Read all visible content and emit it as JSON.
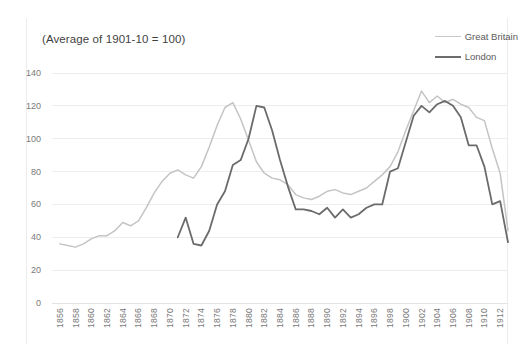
{
  "chart_data": {
    "type": "line",
    "title": "(Average of 1901-10 = 100)",
    "xlabel": "",
    "ylabel": "",
    "ylim": [
      0,
      140
    ],
    "xlim": [
      1855,
      1913
    ],
    "grid": true,
    "legend_position": "top-right",
    "yticks": [
      0,
      20,
      40,
      60,
      80,
      100,
      120,
      140
    ],
    "xticks": [
      1856,
      1858,
      1860,
      1862,
      1864,
      1866,
      1868,
      1870,
      1872,
      1874,
      1876,
      1878,
      1880,
      1882,
      1884,
      1886,
      1888,
      1890,
      1892,
      1894,
      1896,
      1898,
      1900,
      1902,
      1904,
      1906,
      1908,
      1910,
      1912
    ],
    "series": [
      {
        "name": "Great Britain",
        "color": "#c4c4c4",
        "x": [
          1856,
          1857,
          1858,
          1859,
          1860,
          1861,
          1862,
          1863,
          1864,
          1865,
          1866,
          1867,
          1868,
          1869,
          1870,
          1871,
          1872,
          1873,
          1874,
          1875,
          1876,
          1877,
          1878,
          1879,
          1880,
          1881,
          1882,
          1883,
          1884,
          1885,
          1886,
          1887,
          1888,
          1889,
          1890,
          1891,
          1892,
          1893,
          1894,
          1895,
          1896,
          1897,
          1898,
          1899,
          1900,
          1901,
          1902,
          1903,
          1904,
          1905,
          1906,
          1907,
          1908,
          1909,
          1910,
          1911,
          1912,
          1913
        ],
        "values": [
          36,
          35,
          34,
          36,
          39,
          41,
          41,
          44,
          49,
          47,
          50,
          58,
          67,
          74,
          79,
          81,
          78,
          76,
          83,
          95,
          108,
          119,
          122,
          112,
          99,
          86,
          79,
          76,
          75,
          72,
          66,
          64,
          63,
          65,
          68,
          69,
          67,
          66,
          68,
          70,
          74,
          78,
          83,
          92,
          105,
          117,
          129,
          122,
          126,
          122,
          124,
          121,
          119,
          113,
          111,
          94,
          79,
          44
        ]
      },
      {
        "name": "London",
        "color": "#6b6b6b",
        "x": [
          1871,
          1872,
          1873,
          1874,
          1875,
          1876,
          1877,
          1878,
          1879,
          1880,
          1881,
          1882,
          1883,
          1884,
          1885,
          1886,
          1887,
          1888,
          1889,
          1890,
          1891,
          1892,
          1893,
          1894,
          1895,
          1896,
          1897,
          1898,
          1899,
          1900,
          1901,
          1902,
          1903,
          1904,
          1905,
          1906,
          1907,
          1908,
          1909,
          1910,
          1911,
          1912,
          1913
        ],
        "values": [
          40,
          52,
          36,
          35,
          44,
          60,
          68,
          84,
          87,
          100,
          120,
          119,
          105,
          87,
          71,
          57,
          57,
          56,
          54,
          58,
          52,
          57,
          52,
          54,
          58,
          60,
          60,
          80,
          82,
          98,
          114,
          120,
          116,
          121,
          123,
          120,
          113,
          96,
          96,
          83,
          60,
          62,
          37
        ]
      }
    ]
  },
  "legend": {
    "items": [
      {
        "label": "Great Britain",
        "key": "gb"
      },
      {
        "label": "London",
        "key": "ldn"
      }
    ]
  }
}
